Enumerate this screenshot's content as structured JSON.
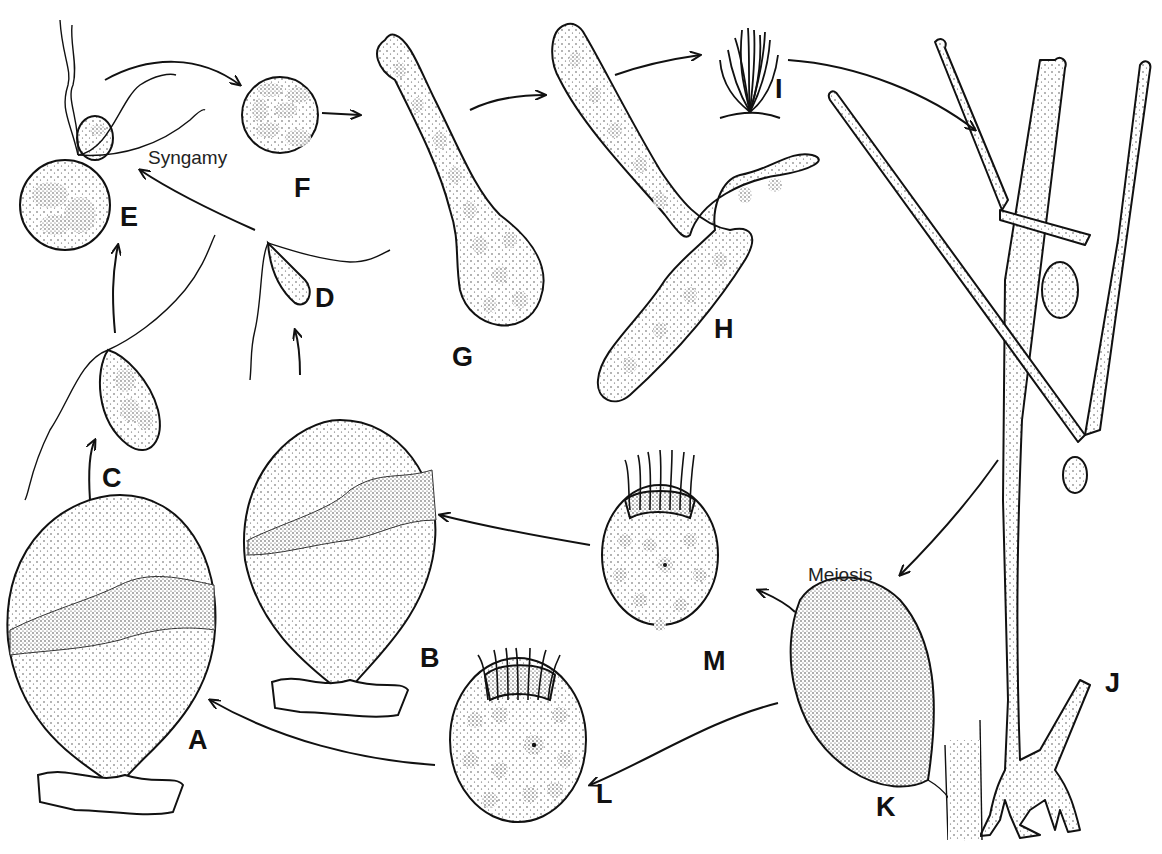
{
  "diagram": {
    "type": "life-cycle",
    "stages": [
      {
        "id": "A",
        "label": "A",
        "description": "large mature gametophyte vesicle attached to substrate"
      },
      {
        "id": "B",
        "label": "B",
        "description": "gametophyte vesicle with dense zone, attached to substrate"
      },
      {
        "id": "C",
        "label": "C",
        "description": "biflagellate gamete"
      },
      {
        "id": "D",
        "label": "D",
        "description": "smaller biflagellate gamete"
      },
      {
        "id": "E",
        "label": "E",
        "description": "fusing gametes"
      },
      {
        "id": "F",
        "label": "F",
        "description": "zygote"
      },
      {
        "id": "G",
        "label": "G",
        "description": "germinating zygote"
      },
      {
        "id": "H",
        "label": "H",
        "description": "branching young sporophyte"
      },
      {
        "id": "I",
        "label": "I",
        "description": "tufted sporophyte habit"
      },
      {
        "id": "J",
        "label": "J",
        "description": "branched sporophyte filaments with sporangia"
      },
      {
        "id": "K",
        "label": "K",
        "description": "sporangium on filament"
      },
      {
        "id": "L",
        "label": "L",
        "description": "stephanokont zoospore"
      },
      {
        "id": "M",
        "label": "M",
        "description": "stephanokont zoospore"
      }
    ],
    "process_labels": {
      "syngamy": "Syngamy",
      "meiosis": "Meiosis"
    },
    "arrows": [
      {
        "from": "E",
        "to": "F"
      },
      {
        "from": "F",
        "to": "G"
      },
      {
        "from": "G",
        "to": "H"
      },
      {
        "from": "H",
        "to": "I"
      },
      {
        "from": "I",
        "to": "J"
      },
      {
        "from": "J",
        "to": "K"
      },
      {
        "from": "K",
        "to": "L"
      },
      {
        "from": "K",
        "to": "M"
      },
      {
        "from": "L",
        "to": "A"
      },
      {
        "from": "M",
        "to": "B"
      },
      {
        "from": "A",
        "to": "C"
      },
      {
        "from": "B",
        "to": "D"
      },
      {
        "from": "C",
        "to": "E"
      },
      {
        "from": "D",
        "to": "E"
      }
    ]
  }
}
